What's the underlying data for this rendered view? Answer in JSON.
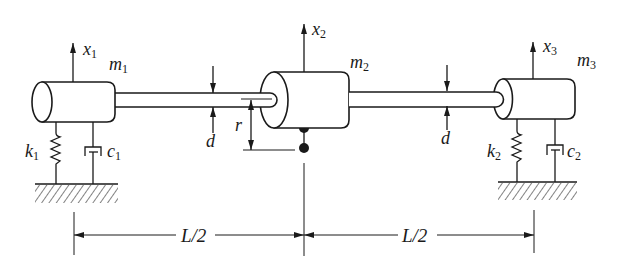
{
  "figure": {
    "masses": [
      {
        "symbol": "m",
        "subscript": "1"
      },
      {
        "symbol": "m",
        "subscript": "2"
      },
      {
        "symbol": "m",
        "subscript": "3"
      }
    ],
    "displacements": [
      {
        "symbol": "x",
        "subscript": "1"
      },
      {
        "symbol": "x",
        "subscript": "2"
      },
      {
        "symbol": "x",
        "subscript": "3"
      }
    ],
    "springs": [
      {
        "symbol": "k",
        "subscript": "1"
      },
      {
        "symbol": "k",
        "subscript": "2"
      }
    ],
    "dampers": [
      {
        "symbol": "c",
        "subscript": "1"
      },
      {
        "symbol": "c",
        "subscript": "2"
      }
    ],
    "dimensions": {
      "shaft_diameter_left": "d",
      "shaft_diameter_right": "d",
      "unbalance_radius": "r",
      "span_left": "L/2",
      "span_right": "L/2"
    }
  },
  "colors": {
    "ink": "#1a1a1a",
    "background": "#ffffff"
  }
}
